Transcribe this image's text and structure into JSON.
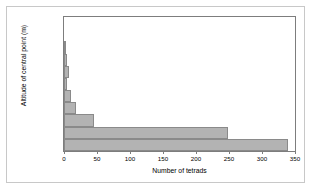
{
  "chart_data": {
    "type": "bar",
    "orientation": "horizontal",
    "title": "",
    "xlabel": "Number of tetrads",
    "ylabel": "Altitude of central point (m)",
    "xlim": [
      0,
      350
    ],
    "xticks": [
      0,
      50,
      100,
      150,
      200,
      250,
      300,
      350
    ],
    "xtick_labels": [
      "0",
      "50",
      "100",
      "150",
      "200",
      "250",
      "300",
      "350"
    ],
    "grid": false,
    "legend": false,
    "bar_color": "#b3b3b3",
    "bar_edge_color": "#8a8a8a",
    "frame_color": "#7d7d7d",
    "categories": [
      "501-550",
      "451-500",
      "401-450",
      "351-400",
      "301-350",
      "251-300",
      "201-250",
      "151-200",
      "101-150",
      "51-100",
      "0-50"
    ],
    "values": [
      0,
      0,
      3,
      4,
      7,
      5,
      11,
      18,
      45,
      248,
      340
    ]
  }
}
